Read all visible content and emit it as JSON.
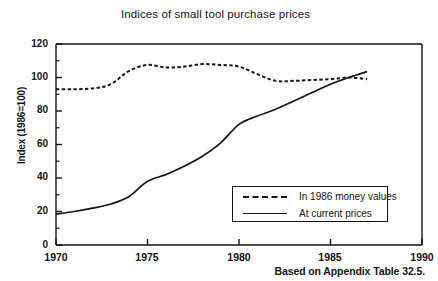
{
  "chart_data": {
    "type": "line",
    "title": "Indices of small tool purchase prices",
    "caption": "Based on Appendix Table 32.5.",
    "xlabel": "",
    "ylabel": "Index (1986=100)",
    "xlim": [
      1970,
      1990
    ],
    "ylim": [
      0,
      120
    ],
    "xticks": [
      1970,
      1975,
      1980,
      1985,
      1990
    ],
    "xtick_labels": [
      "1970",
      "1975",
      "1980",
      "1985",
      "1990"
    ],
    "yticks": [
      0,
      20,
      40,
      60,
      80,
      100,
      120
    ],
    "ytick_labels": [
      "0",
      "20",
      "40",
      "60",
      "80",
      "100",
      "120"
    ],
    "yticks_minor": [
      10,
      30,
      50,
      70,
      90,
      110
    ],
    "grid": false,
    "legend_position": "lower right",
    "series": [
      {
        "name": "In 1986 money values",
        "style": "dashed",
        "color": "#141414",
        "x": [
          1970,
          1971,
          1972,
          1973,
          1974,
          1975,
          1976,
          1977,
          1978,
          1979,
          1980,
          1981,
          1982,
          1983,
          1984,
          1985,
          1986,
          1987
        ],
        "values": [
          93,
          93,
          93.5,
          96,
          104,
          107.5,
          106,
          106.5,
          108,
          107.5,
          106.5,
          102,
          98,
          98,
          98.5,
          99,
          100,
          99
        ]
      },
      {
        "name": "At current prices",
        "style": "solid",
        "color": "#141414",
        "x": [
          1970,
          1971,
          1972,
          1973,
          1974,
          1975,
          1976,
          1977,
          1978,
          1979,
          1980,
          1981,
          1982,
          1983,
          1984,
          1985,
          1986,
          1987
        ],
        "values": [
          18.5,
          20,
          22,
          24.5,
          29,
          38,
          42,
          47,
          53,
          61,
          72,
          77,
          81,
          86,
          91,
          96,
          100,
          103.5
        ]
      }
    ]
  },
  "legend": {
    "entries": [
      {
        "label": "In 1986 money values"
      },
      {
        "label": "At current prices"
      }
    ]
  },
  "axes": {
    "y_label": "Index (1986=100)",
    "y_tick_labels": [
      "120",
      "100",
      "80",
      "60",
      "40",
      "20",
      "0"
    ],
    "x_tick_labels": [
      "1970",
      "1975",
      "1980",
      "1985",
      "1990"
    ]
  },
  "colors": {
    "ink": "#141414",
    "background": "#ffffff"
  }
}
